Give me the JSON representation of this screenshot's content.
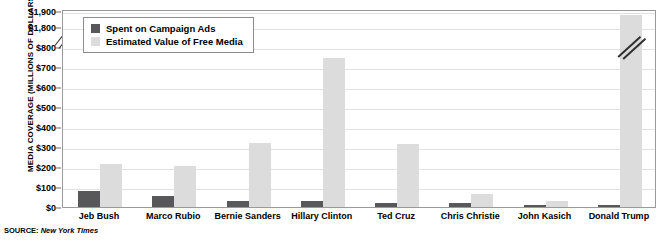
{
  "chart_data": {
    "type": "bar",
    "title": "",
    "xlabel": "",
    "ylabel": "MEDIA COVERAGE (MILLIONS OF DOLLARS)",
    "categories": [
      "Jeb Bush",
      "Marco Rubio",
      "Bernie Sanders",
      "Hillary Clinton",
      "Ted Cruz",
      "Chris Christie",
      "John Kasich",
      "Donald Trump"
    ],
    "series": [
      {
        "name": "Spent on Campaign Ads",
        "color": "#58585a",
        "values": [
          82,
          55,
          28,
          28,
          22,
          18,
          10,
          10
        ]
      },
      {
        "name": "Estimated Value of Free Media",
        "color": "#dcdcdc",
        "values": [
          214,
          204,
          321,
          746,
          313,
          65,
          30,
          1898
        ]
      }
    ],
    "ylim": [
      0,
      800
    ],
    "yticks": [
      "$0",
      "$100",
      "$200",
      "$300",
      "$400",
      "$500",
      "$600",
      "$700",
      "$800",
      "$1,800",
      "$1,900"
    ],
    "axis_break": {
      "below": 800,
      "above": 1800,
      "label": "axis-break-marker"
    },
    "grid": true,
    "legend_position": "top-left",
    "annotations": [
      "Donald Trump free-media bar is truncated by the axis break"
    ]
  },
  "legend": {
    "items": [
      {
        "label": "Spent on Campaign Ads",
        "swatch": "dark-swatch"
      },
      {
        "label": "Estimated Value of Free Media",
        "swatch": "light-swatch"
      }
    ]
  },
  "source": {
    "prefix": "SOURCE:",
    "name": "New York Times"
  }
}
